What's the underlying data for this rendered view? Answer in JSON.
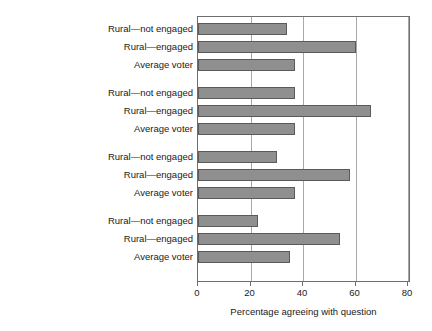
{
  "chart_data": {
    "type": "bar",
    "orientation": "horizontal",
    "title": "",
    "xlabel": "Percentage agreeing with question",
    "ylabel": "",
    "xlim": [
      0,
      84
    ],
    "xticks": [
      0,
      20,
      40,
      60,
      80
    ],
    "xtick_labels": [
      "0",
      "20",
      "40",
      "60",
      "80"
    ],
    "grid": "vertical",
    "legend": "none",
    "series_names": [
      "Rural—not engaged",
      "Rural—engaged",
      "Average voter"
    ],
    "categories": [
      "Dems. run sex ring",
      "January 6th peaceful",
      "Replacement theory",
      "USA should split up"
    ],
    "groups": [
      {
        "category": "Dems. run sex ring",
        "bars": [
          {
            "series": "Rural—not engaged",
            "value": 34
          },
          {
            "series": "Rural—engaged",
            "value": 60
          },
          {
            "series": "Average voter",
            "value": 37
          }
        ]
      },
      {
        "category": "January 6th peaceful",
        "bars": [
          {
            "series": "Rural—not engaged",
            "value": 37
          },
          {
            "series": "Rural—engaged",
            "value": 66
          },
          {
            "series": "Average voter",
            "value": 37
          }
        ]
      },
      {
        "category": "Replacement theory",
        "bars": [
          {
            "series": "Rural—not engaged",
            "value": 30
          },
          {
            "series": "Rural—engaged",
            "value": 58
          },
          {
            "series": "Average voter",
            "value": 37
          }
        ]
      },
      {
        "category": "USA should split up",
        "bars": [
          {
            "series": "Rural—not engaged",
            "value": 23
          },
          {
            "series": "Rural—engaged",
            "value": 54
          },
          {
            "series": "Average voter",
            "value": 35
          }
        ]
      }
    ],
    "colors": {
      "bar_fill": "#8f8f8f",
      "bar_edge": "#5a5a5a",
      "grid": "#a8a8a8",
      "axis": "#6e6e6e",
      "text": "#1a1a1a",
      "background": "#ffffff"
    }
  }
}
